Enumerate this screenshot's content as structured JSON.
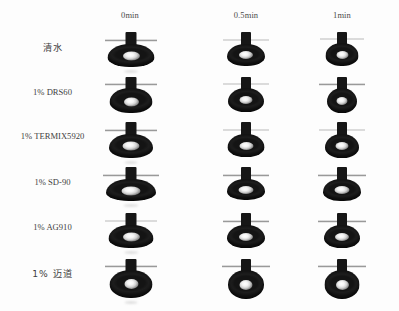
{
  "figure": {
    "background_color": "#fdfdfd",
    "drop_color": "#141414",
    "highlight_color": "#ffffff",
    "baseline_color": "#9a9a9a"
  },
  "columns": [
    {
      "label": "0min",
      "x": 130
    },
    {
      "label": "0.5min",
      "x": 246
    },
    {
      "label": "1min",
      "x": 342
    }
  ],
  "rows": [
    {
      "label": "清水",
      "cjk": true,
      "y": 47
    },
    {
      "label": "1% DRS60",
      "cjk": false,
      "y": 92
    },
    {
      "label": "1% TERMIX5920",
      "cjk": false,
      "y": 136
    },
    {
      "label": "1% SD-90",
      "cjk": false,
      "y": 182
    },
    {
      "label": "1% AG910",
      "cjk": false,
      "y": 227
    },
    {
      "label": "1% 迈道",
      "cjk": true,
      "y": 273
    }
  ],
  "cells": [
    {
      "row": 0,
      "col": 0,
      "cx": 131,
      "cy": 46,
      "w": 52,
      "h": 40,
      "drop_w": 47,
      "drop_h": 23,
      "drop_r": "47% 47% 46% 46% / 60% 60% 40% 40%",
      "needle_w": 11,
      "needle_h": 13,
      "hl_w": 17,
      "hl_h": 9,
      "hl_y": 0.54,
      "base_y": 13,
      "base_w": 52,
      "baseline_style": "thick",
      "smear": true
    },
    {
      "row": 0,
      "col": 1,
      "cx": 246,
      "cy": 46,
      "w": 46,
      "h": 40,
      "drop_w": 38,
      "drop_h": 22,
      "drop_r": "47% 47% 46% 46% / 58% 58% 42% 42%",
      "needle_w": 10,
      "needle_h": 13,
      "hl_w": 14,
      "hl_h": 8,
      "hl_y": 0.52,
      "base_y": 13,
      "base_w": 46,
      "baseline_style": "thin",
      "smear": false
    },
    {
      "row": 0,
      "col": 2,
      "cx": 342,
      "cy": 46,
      "w": 44,
      "h": 40,
      "drop_w": 33,
      "drop_h": 23,
      "drop_r": "48% 48% 46% 46% / 56% 56% 44% 44%",
      "needle_w": 10,
      "needle_h": 12,
      "hl_w": 12,
      "hl_h": 8,
      "hl_y": 0.52,
      "base_y": 12,
      "base_w": 44,
      "baseline_style": "thin",
      "smear": false
    },
    {
      "row": 1,
      "col": 0,
      "cx": 131,
      "cy": 92,
      "w": 52,
      "h": 40,
      "drop_w": 43,
      "drop_h": 25,
      "drop_r": "48% 48% 46% 46% / 56% 56% 44% 44%",
      "needle_w": 11,
      "needle_h": 12,
      "hl_w": 15,
      "hl_h": 9,
      "hl_y": 0.54,
      "base_y": 11,
      "base_w": 52,
      "baseline_style": "thick",
      "smear": false
    },
    {
      "row": 1,
      "col": 1,
      "cx": 246,
      "cy": 92,
      "w": 46,
      "h": 40,
      "drop_w": 36,
      "drop_h": 24,
      "drop_r": "48% 48% 46% 46% / 56% 56% 44% 44%",
      "needle_w": 10,
      "needle_h": 12,
      "hl_w": 13,
      "hl_h": 8,
      "hl_y": 0.52,
      "base_y": 11,
      "base_w": 46,
      "baseline_style": "thin",
      "smear": false
    },
    {
      "row": 1,
      "col": 2,
      "cx": 342,
      "cy": 92,
      "w": 46,
      "h": 40,
      "drop_w": 30,
      "drop_h": 25,
      "drop_r": "49% 49% 47% 47% / 54% 54% 46% 46%",
      "needle_w": 10,
      "needle_h": 12,
      "hl_w": 11,
      "hl_h": 8,
      "hl_y": 0.52,
      "base_y": 11,
      "base_w": 46,
      "baseline_style": "thick",
      "smear": false
    },
    {
      "row": 2,
      "col": 0,
      "cx": 131,
      "cy": 137,
      "w": 52,
      "h": 40,
      "drop_w": 44,
      "drop_h": 24,
      "drop_r": "47% 47% 46% 46% / 58% 58% 42% 42%",
      "needle_w": 11,
      "needle_h": 13,
      "hl_w": 17,
      "hl_h": 9,
      "hl_y": 0.5,
      "base_y": 12,
      "base_w": 52,
      "baseline_style": "thick",
      "smear": true
    },
    {
      "row": 2,
      "col": 1,
      "cx": 246,
      "cy": 137,
      "w": 46,
      "h": 40,
      "drop_w": 37,
      "drop_h": 23,
      "drop_r": "47% 47% 46% 46% / 58% 58% 42% 42%",
      "needle_w": 10,
      "needle_h": 13,
      "hl_w": 14,
      "hl_h": 8,
      "hl_y": 0.52,
      "base_y": 12,
      "base_w": 46,
      "baseline_style": "thin",
      "smear": false
    },
    {
      "row": 2,
      "col": 2,
      "cx": 342,
      "cy": 137,
      "w": 46,
      "h": 40,
      "drop_w": 34,
      "drop_h": 24,
      "drop_r": "48% 48% 46% 46% / 56% 56% 44% 44%",
      "needle_w": 10,
      "needle_h": 13,
      "hl_w": 13,
      "hl_h": 8,
      "hl_y": 0.52,
      "base_y": 12,
      "base_w": 46,
      "baseline_style": "thin",
      "smear": false
    },
    {
      "row": 2.5,
      "col": 0,
      "cx": 131,
      "cy": 182,
      "w": 56,
      "h": 40,
      "drop_w": 50,
      "drop_h": 22,
      "drop_r": "46% 46% 45% 45% / 62% 62% 38% 38%",
      "needle_w": 11,
      "needle_h": 13,
      "hl_w": 19,
      "hl_h": 9,
      "hl_y": 0.54,
      "base_y": 12,
      "base_w": 56,
      "baseline_style": "thick",
      "smear": true
    },
    {
      "row": 2.5,
      "col": 1,
      "cx": 246,
      "cy": 182,
      "w": 46,
      "h": 40,
      "drop_w": 38,
      "drop_h": 21,
      "drop_r": "46% 46% 45% 45% / 60% 60% 40% 40%",
      "needle_w": 10,
      "needle_h": 13,
      "hl_w": 15,
      "hl_h": 8,
      "hl_y": 0.54,
      "base_y": 12,
      "base_w": 46,
      "baseline_style": "thick",
      "smear": false
    },
    {
      "row": 2.5,
      "col": 2,
      "cx": 342,
      "cy": 182,
      "w": 48,
      "h": 40,
      "drop_w": 38,
      "drop_h": 22,
      "drop_r": "46% 46% 45% 45% / 60% 60% 40% 40%",
      "needle_w": 10,
      "needle_h": 13,
      "hl_w": 15,
      "hl_h": 8,
      "hl_y": 0.52,
      "base_y": 12,
      "base_w": 48,
      "baseline_style": "thick",
      "smear": false
    },
    {
      "row": 4,
      "col": 0,
      "cx": 131,
      "cy": 228,
      "w": 52,
      "h": 40,
      "drop_w": 45,
      "drop_h": 23,
      "drop_r": "46% 46% 45% 45% / 60% 60% 40% 40%",
      "needle_w": 11,
      "needle_h": 13,
      "hl_w": 17,
      "hl_h": 9,
      "hl_y": 0.5,
      "base_y": 12,
      "base_w": 52,
      "baseline_style": "thin",
      "smear": true
    },
    {
      "row": 4,
      "col": 1,
      "cx": 246,
      "cy": 228,
      "w": 46,
      "h": 40,
      "drop_w": 38,
      "drop_h": 23,
      "drop_r": "47% 47% 46% 46% / 58% 58% 42% 42%",
      "needle_w": 10,
      "needle_h": 13,
      "hl_w": 14,
      "hl_h": 8,
      "hl_y": 0.52,
      "base_y": 12,
      "base_w": 46,
      "baseline_style": "thick",
      "smear": false
    },
    {
      "row": 4,
      "col": 2,
      "cx": 342,
      "cy": 228,
      "w": 48,
      "h": 40,
      "drop_w": 36,
      "drop_h": 23,
      "drop_r": "47% 47% 46% 46% / 58% 58% 42% 42%",
      "needle_w": 10,
      "needle_h": 13,
      "hl_w": 14,
      "hl_h": 8,
      "hl_y": 0.52,
      "base_y": 12,
      "base_w": 48,
      "baseline_style": "thick",
      "smear": false
    },
    {
      "row": 5,
      "col": 0,
      "cx": 131,
      "cy": 276,
      "w": 52,
      "h": 42,
      "drop_w": 43,
      "drop_h": 28,
      "drop_r": "50% 50% 48% 48% / 52% 52% 48% 48%",
      "needle_w": 11,
      "needle_h": 12,
      "hl_w": 14,
      "hl_h": 10,
      "hl_y": 0.5,
      "base_y": 10,
      "base_w": 52,
      "baseline_style": "thick",
      "smear": true
    },
    {
      "row": 5,
      "col": 1,
      "cx": 246,
      "cy": 276,
      "w": 48,
      "h": 42,
      "drop_w": 36,
      "drop_h": 29,
      "drop_r": "51% 51% 49% 49% / 50% 50% 50% 50%",
      "needle_w": 10,
      "needle_h": 12,
      "hl_w": 13,
      "hl_h": 10,
      "hl_y": 0.5,
      "base_y": 10,
      "base_w": 48,
      "baseline_style": "thick",
      "smear": false
    },
    {
      "row": 5,
      "col": 2,
      "cx": 342,
      "cy": 276,
      "w": 48,
      "h": 42,
      "drop_w": 35,
      "drop_h": 29,
      "drop_r": "51% 51% 49% 49% / 50% 50% 50% 50%",
      "needle_w": 10,
      "needle_h": 12,
      "hl_w": 13,
      "hl_h": 10,
      "hl_y": 0.5,
      "base_y": 10,
      "base_w": 48,
      "baseline_style": "thick",
      "smear": false
    }
  ]
}
